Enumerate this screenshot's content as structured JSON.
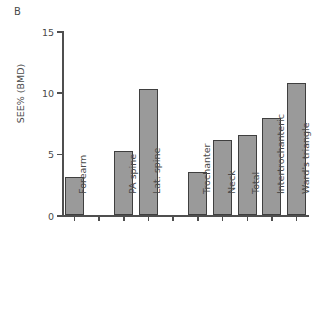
{
  "panel": {
    "label": "B"
  },
  "chart_data": {
    "type": "bar",
    "title": "",
    "xlabel": "",
    "ylabel": "SEE% (BMD)",
    "ylim": [
      0,
      15
    ],
    "yticks": [
      0,
      5,
      10,
      15
    ],
    "ytick_labels": [
      "0",
      "5",
      "10",
      "15"
    ],
    "grid": false,
    "legend": null,
    "categories": [
      "Forearm",
      "PA spine",
      "Lat. spine",
      "Trochanter",
      "Neck",
      "Total",
      "Intertrochanteric",
      "Ward's triangle"
    ],
    "values": [
      3.1,
      5.2,
      10.3,
      3.5,
      6.1,
      6.5,
      7.9,
      10.8
    ],
    "groups": [
      {
        "name": "Forearm",
        "categories": [
          "Forearm"
        ]
      },
      {
        "name": "Spine",
        "categories": [
          "PA spine",
          "Lat. spine"
        ]
      },
      {
        "name": "Hip",
        "categories": [
          "Trochanter",
          "Neck",
          "Total",
          "Intertrochanteric",
          "Ward's triangle"
        ]
      }
    ],
    "slots": [
      {
        "index": 0,
        "category": "Forearm",
        "value": 3.1
      },
      {
        "index": 1,
        "category": "",
        "value": null
      },
      {
        "index": 2,
        "category": "PA spine",
        "value": 5.2
      },
      {
        "index": 3,
        "category": "Lat. spine",
        "value": 10.3
      },
      {
        "index": 4,
        "category": "",
        "value": null
      },
      {
        "index": 5,
        "category": "Trochanter",
        "value": 3.5
      },
      {
        "index": 6,
        "category": "Neck",
        "value": 6.1
      },
      {
        "index": 7,
        "category": "Total",
        "value": 6.5
      },
      {
        "index": 8,
        "category": "Intertrochanteric",
        "value": 7.9
      },
      {
        "index": 9,
        "category": "Ward's triangle",
        "value": 10.8
      }
    ],
    "colors": {
      "bar_fill": "#9a9a9a",
      "bar_edge": "#3f3f3f",
      "axis": "#4f4f4f",
      "text": "#4a4a4a",
      "background": "#ffffff"
    }
  }
}
